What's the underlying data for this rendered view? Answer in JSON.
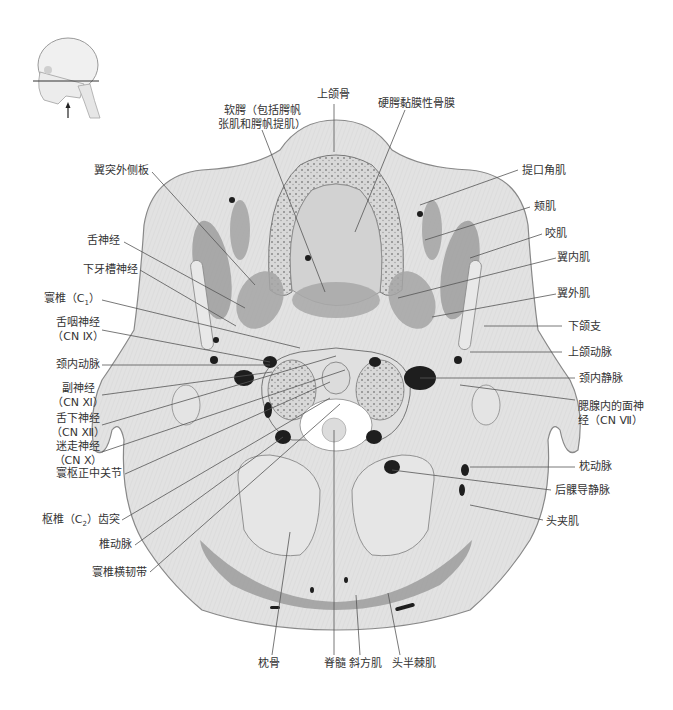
{
  "figure": {
    "orientation_inset": {
      "name": "head-profile-inset",
      "cut_line": "horizontal plane through C1",
      "arrow": "view from below"
    }
  },
  "labels": {
    "top": {
      "soft_palate": [
        "软腭（包括腭帆",
        "张肌和腭帆提肌）"
      ],
      "maxilla": "上颌骨",
      "hard_palate_mucoperiosteum": "硬腭黏膜性骨膜"
    },
    "left": {
      "lateral_pterygoid_plate": "翼突外侧板",
      "lingual_nerve": "舌神经",
      "inferior_alveolar_nerve": "下牙槽神经",
      "atlas_c1": "寰椎（C",
      "atlas_c1_sub": "1",
      "atlas_c1_end": "）",
      "glossopharyngeal_nerve": [
        "舌咽神经",
        "（CN Ⅸ）"
      ],
      "internal_carotid_artery": "颈内动脉",
      "accessory_nerve": [
        "副神经",
        "（CN Ⅺ）"
      ],
      "hypoglossal_nerve": [
        "舌下神经",
        "（CN Ⅻ）"
      ],
      "vagus_nerve": [
        "迷走神经",
        "（CN Ⅹ）"
      ],
      "median_atlantoaxial_joint": "寰枢正中关节",
      "dens_c2": "枢椎（C",
      "dens_c2_sub": "2",
      "dens_c2_end": "）齿突",
      "vertebral_artery": "椎动脉",
      "transverse_ligament_atlas": "寰椎横韧带"
    },
    "right": {
      "levator_anguli_oris": "提口角肌",
      "buccinator": "颊肌",
      "masseter": "咬肌",
      "medial_pterygoid": "翼内肌",
      "lateral_pterygoid": "翼外肌",
      "ramus_mandible": "下颌支",
      "maxillary_artery": "上颌动脉",
      "internal_jugular_vein": "颈内静脉",
      "facial_nerve_parotid": [
        "腮腺内的面神",
        "经（CN Ⅶ）"
      ],
      "occipital_artery": "枕动脉",
      "posterior_condylar_emissary_vein": "后髁导静脉",
      "splenius_capitis": "头夹肌"
    },
    "bottom": {
      "occipital_bone": "枕骨",
      "spinal_cord": "脊髓",
      "trapezius": "斜方肌",
      "semispinalis_capitis": "头半棘肌"
    }
  },
  "colors": {
    "tissue_light": "#e4e4e4",
    "tissue_mid": "#cfcfcf",
    "muscle_dark": "#9a9a9a",
    "vessel": "#1e1e1e",
    "leader_line": "#555555",
    "text": "#333333"
  }
}
